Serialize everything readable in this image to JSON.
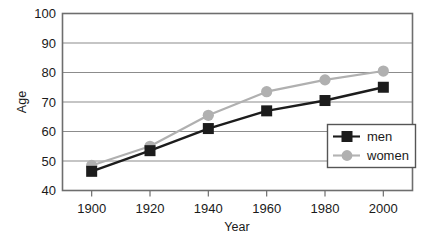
{
  "chart_data": {
    "type": "line",
    "title": "",
    "xlabel": "Year",
    "ylabel": "Age",
    "x": [
      1900,
      1920,
      1940,
      1960,
      1980,
      2000
    ],
    "xtick_labels": [
      "1900",
      "1920",
      "1940",
      "1960",
      "1980",
      "2000"
    ],
    "ytick_labels": [
      "40",
      "50",
      "60",
      "70",
      "80",
      "90",
      "100"
    ],
    "yticks": [
      40,
      50,
      60,
      70,
      80,
      90,
      100
    ],
    "xlim": [
      1890,
      2010
    ],
    "ylim": [
      40,
      100
    ],
    "grid": "horizontal",
    "legend_position": "bottom-right",
    "series": [
      {
        "name": "men",
        "values": [
          46.5,
          53.5,
          61,
          67,
          70.5,
          75
        ],
        "color": "#1c1c1c",
        "marker": "square"
      },
      {
        "name": "women",
        "values": [
          48.5,
          55,
          65.5,
          73.5,
          77.5,
          80.5
        ],
        "color": "#b0b0b0",
        "marker": "circle"
      }
    ]
  },
  "legend": {
    "entries": [
      {
        "label": "men"
      },
      {
        "label": "women"
      }
    ]
  },
  "colors": {
    "men_line": "#1c1c1c",
    "women_line": "#b3b3b3",
    "gridline": "#8c8c8c",
    "frame": "#6e6e6e",
    "background": "#ffffff"
  }
}
